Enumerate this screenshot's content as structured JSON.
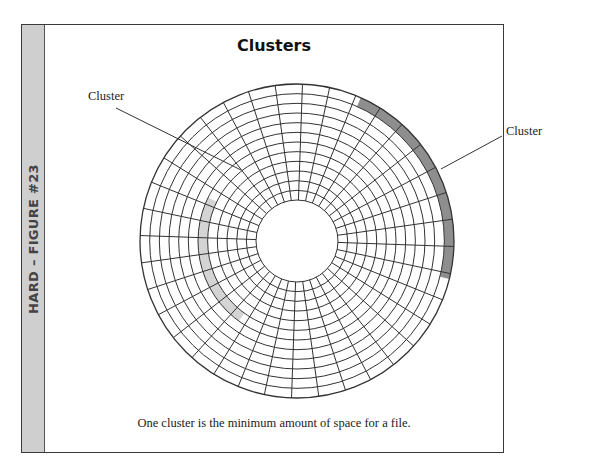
{
  "figure": {
    "side_label": "HARD – FIGURE #23",
    "title": "Clusters",
    "caption": "One cluster is the minimum amount of space for a file.",
    "labels": {
      "left_cluster": "Cluster",
      "right_cluster": "Cluster"
    },
    "colors": {
      "side_tab": "#cfcfcf",
      "dark_cluster": "#8e8e8e",
      "light_cluster": "#d4d4d4",
      "grid": "#333333"
    },
    "disk": {
      "center": [
        297,
        241
      ],
      "outer_radius": 157,
      "inner_radius": 41,
      "tracks": 12,
      "sectors": 36,
      "highlighted_clusters": [
        {
          "name": "dark-cluster",
          "track_from_outside": 0,
          "start_angle_deg": -66,
          "end_angle_deg": 14,
          "shade": "dark"
        },
        {
          "name": "light-cluster",
          "track_from_outside": 6,
          "start_angle_deg": 126,
          "end_angle_deg": 206,
          "shade": "light"
        }
      ]
    }
  }
}
